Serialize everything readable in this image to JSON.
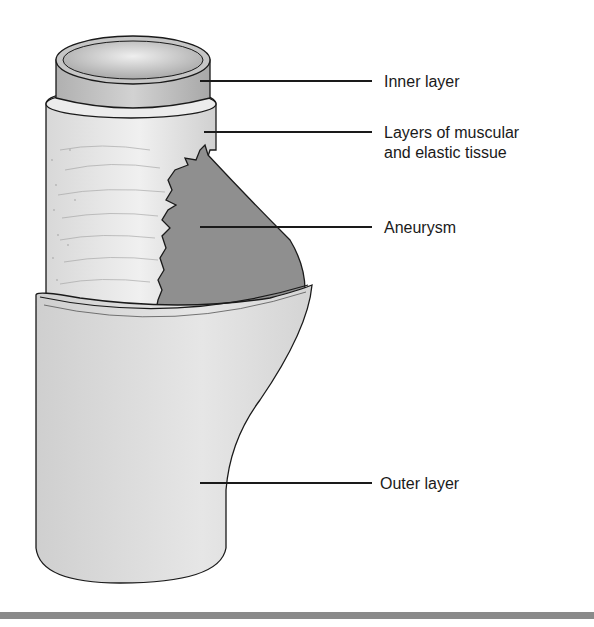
{
  "diagram": {
    "title": "",
    "labels": [
      {
        "id": "inner-layer",
        "text": "Inner layer"
      },
      {
        "id": "muscular-elastic",
        "text_line1": "Layers of muscular",
        "text_line2": "and elastic tissue"
      },
      {
        "id": "aneurysm",
        "text": "Aneurysm"
      },
      {
        "id": "outer-layer",
        "text": "Outer layer"
      }
    ],
    "colors": {
      "inner_layer": "#bdbdbd",
      "inner_lumen": "#d6d6d6",
      "muscular_layer": "#e4e4e4",
      "aneurysm": "#8f8f8f",
      "outer_layer": "#dcdcdc",
      "outline": "#1a1a1a",
      "bottom_bar": "#8a8a8a"
    }
  }
}
